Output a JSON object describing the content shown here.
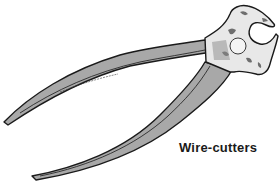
{
  "figure": {
    "caption": "Wire-cutters",
    "colors": {
      "background": "#ffffff",
      "handle_fill": "#a8a8a8",
      "outline": "#1a1a1a",
      "head_fill": "#e8e8e8",
      "head_shade": "#6e6e6e"
    }
  }
}
